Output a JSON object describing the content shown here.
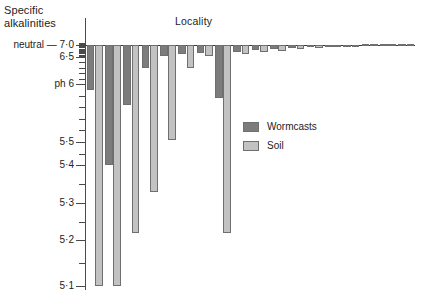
{
  "axis_title": "Specific\nalkalinities",
  "axis_title_line1": "Specific",
  "axis_title_line2": "alkalinities",
  "neutral_prefix": "neutral —",
  "chart_data": {
    "type": "bar",
    "title": "Locality",
    "xlabel": "Locality",
    "ylabel": "Specific alkalinities",
    "grid": false,
    "legend_position": "center-right",
    "ylim": [
      5.1,
      7.15
    ],
    "y_tick_labels": [
      "7·0",
      "6·5",
      "ph 6",
      "5·5",
      "5·4",
      "5·3",
      "5·2",
      "5·1"
    ],
    "y_tick_values": [
      7.0,
      6.5,
      6.0,
      5.5,
      5.4,
      5.3,
      5.2,
      5.1
    ],
    "y_axis_note": "non-linear (hydrogen-ion concentration) scale; neutral at ph 7·0",
    "neutral_value": 7.0,
    "categories": [
      "1",
      "2",
      "3",
      "4",
      "5",
      "6",
      "7",
      "8",
      "9",
      "10",
      "11",
      "12",
      "13",
      "14",
      "15",
      "16",
      "17",
      "18"
    ],
    "series": [
      {
        "name": "Wormcasts",
        "color": "#7c7c7c",
        "values": [
          5.95,
          5.4,
          5.82,
          6.3,
          6.55,
          6.62,
          6.68,
          5.88,
          6.72,
          6.8,
          6.82,
          6.86,
          6.9,
          6.93,
          6.96,
          7.03,
          7.05,
          7.04
        ]
      },
      {
        "name": "Soil",
        "color": "#c2c2c2",
        "values": [
          5.1,
          5.1,
          5.22,
          5.33,
          5.52,
          6.3,
          6.55,
          5.22,
          6.62,
          6.7,
          6.76,
          6.84,
          6.88,
          6.92,
          6.96,
          7.04,
          7.06,
          7.05
        ]
      }
    ]
  },
  "legend": {
    "items": [
      {
        "label": "Wormcasts",
        "swatch": "wormcasts"
      },
      {
        "label": "Soil",
        "swatch": "soil"
      }
    ]
  }
}
